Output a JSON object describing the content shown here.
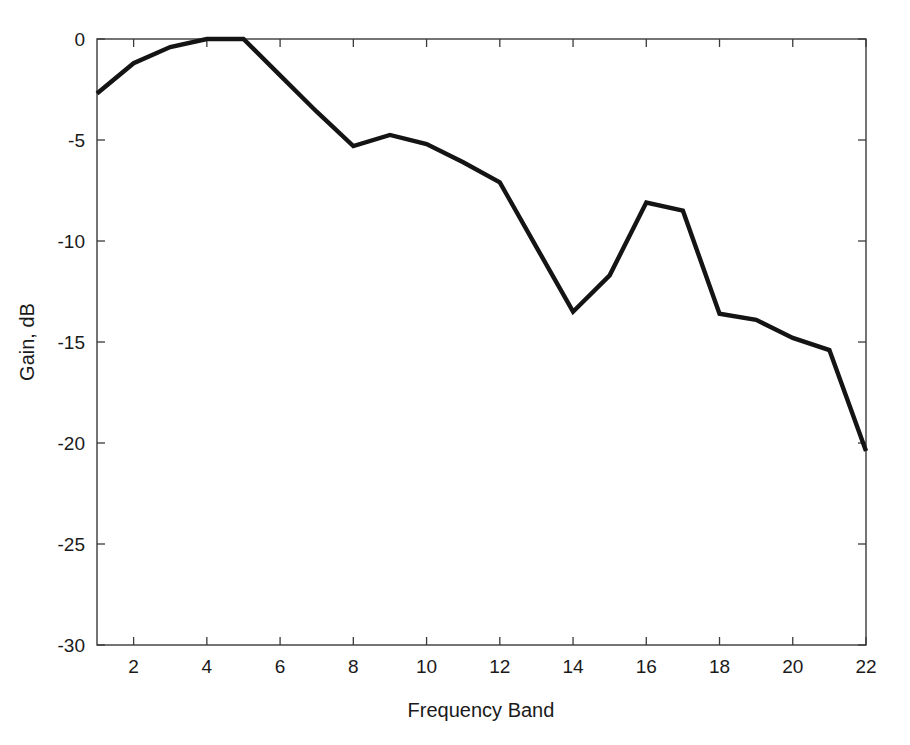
{
  "chart_data": {
    "type": "line",
    "title": "",
    "xlabel": "Frequency Band",
    "ylabel": "Gain, dB",
    "xlim": [
      1,
      22
    ],
    "ylim": [
      -30,
      0
    ],
    "grid": false,
    "legend": null,
    "xticks": [
      2,
      4,
      6,
      8,
      10,
      12,
      14,
      16,
      18,
      20,
      22
    ],
    "xtick_labels": [
      "2",
      "4",
      "6",
      "8",
      "10",
      "12",
      "14",
      "16",
      "18",
      "20",
      "22"
    ],
    "yticks": [
      0,
      -5,
      -10,
      -15,
      -20,
      -25,
      -30
    ],
    "ytick_labels": [
      "0",
      "-5",
      "-10",
      "-15",
      "-20",
      "-25",
      "-30"
    ],
    "x": [
      1,
      2,
      3,
      4,
      5,
      6,
      7,
      8,
      9,
      10,
      11,
      12,
      13,
      14,
      15,
      16,
      17,
      18,
      19,
      20,
      21,
      22
    ],
    "series": [
      {
        "name": "Gain",
        "color": "#141414",
        "values": [
          -2.7,
          -1.2,
          -0.4,
          0.0,
          0.0,
          -1.8,
          -3.6,
          -5.3,
          -4.75,
          -5.2,
          -6.1,
          -7.1,
          -10.3,
          -13.5,
          -11.7,
          -8.1,
          -8.5,
          -13.6,
          -13.9,
          -14.8,
          -15.4,
          -20.4
        ]
      }
    ]
  },
  "axes": {
    "x_axis_name": "Frequency Band",
    "y_axis_name": "Gain, dB"
  }
}
